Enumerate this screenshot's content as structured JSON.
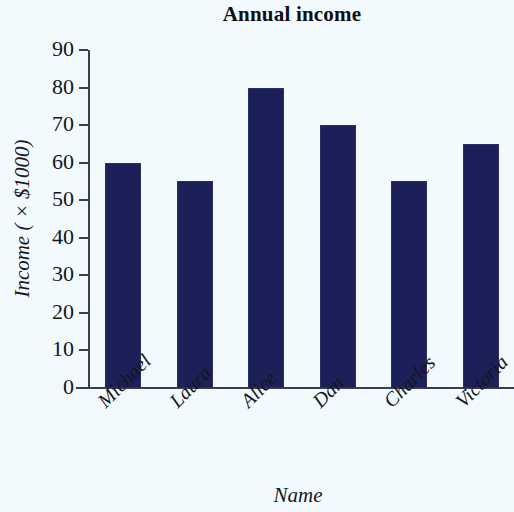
{
  "chart_data": {
    "type": "bar",
    "title": "Annual income",
    "xlabel": "Name",
    "ylabel": "Income ( × $1000)",
    "categories": [
      "Michael",
      "Laura",
      "Alice",
      "Dan",
      "Charles",
      "Victoria"
    ],
    "values": [
      60,
      55,
      80,
      70,
      55,
      65
    ],
    "ylim": [
      0,
      90
    ],
    "ytick_labels": [
      "90",
      "80",
      "70",
      "60",
      "50",
      "40",
      "30",
      "20",
      "10",
      "0"
    ],
    "ytick_values": [
      90,
      80,
      70,
      60,
      50,
      40,
      30,
      20,
      10,
      0
    ],
    "grid": false,
    "legend": false,
    "bar_color": "#1b2059",
    "background_color": "#f2fafd",
    "axis_color": "#3a3f50",
    "text_color": "#15151c"
  }
}
